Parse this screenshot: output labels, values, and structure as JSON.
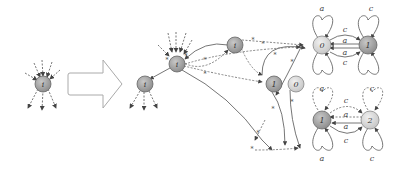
{
  "diagram": {
    "colors": {
      "dark_node": "#9a9a9a",
      "light_node": "#d6d6d6",
      "node_stroke": "#666666",
      "edge": "#666666",
      "arrow_outline": "#aaaaaa"
    },
    "left": {
      "node": {
        "id": "left-i",
        "label": "i"
      }
    },
    "arrow": {
      "label": ""
    },
    "right": {
      "nodes": [
        {
          "id": "i-top",
          "label": "i"
        },
        {
          "id": "i-center",
          "label": "i"
        },
        {
          "id": "i-bottom",
          "label": "i"
        },
        {
          "id": "n1-mid",
          "label": "1"
        },
        {
          "id": "n0-mid",
          "label": "0"
        },
        {
          "id": "top-0",
          "label": "0"
        },
        {
          "id": "top-1",
          "label": "1"
        },
        {
          "id": "bot-1",
          "label": "1"
        },
        {
          "id": "bot-2",
          "label": "2"
        }
      ],
      "edge_labels": {
        "star": "*",
        "a": "a",
        "c": "c"
      }
    }
  }
}
